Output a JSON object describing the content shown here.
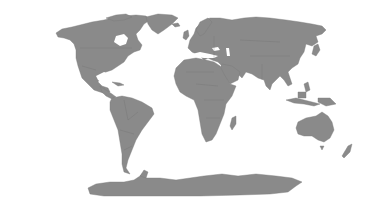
{
  "map": {
    "type": "world-political-outline",
    "projection": "equirectangular-like",
    "land_color": "#8a8a8a",
    "background_color": "#ffffff",
    "continents": [
      "North America",
      "South America",
      "Europe",
      "Africa",
      "Asia",
      "Australia",
      "Antarctica",
      "Greenland"
    ]
  }
}
